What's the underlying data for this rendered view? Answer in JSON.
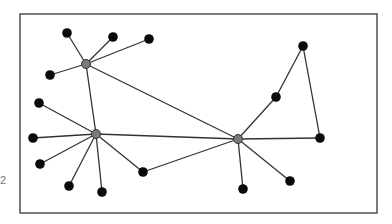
{
  "diagram": {
    "type": "network-graph",
    "frame": {
      "x": 20,
      "y": 14,
      "width": 357,
      "height": 199
    },
    "side_label": "2",
    "colors": {
      "leaf": "#0a0a0a",
      "hub": "#7a7a7a",
      "edge": "#333333",
      "frame": "#444444"
    },
    "nodes": [
      {
        "id": "A",
        "x": 86,
        "y": 64,
        "kind": "hub"
      },
      {
        "id": "B",
        "x": 96,
        "y": 134,
        "kind": "hub"
      },
      {
        "id": "C",
        "x": 238,
        "y": 139,
        "kind": "hub"
      },
      {
        "id": "a1",
        "x": 67,
        "y": 33,
        "kind": "leaf"
      },
      {
        "id": "a2",
        "x": 113,
        "y": 37,
        "kind": "leaf"
      },
      {
        "id": "a3",
        "x": 149,
        "y": 39,
        "kind": "leaf"
      },
      {
        "id": "a4",
        "x": 50,
        "y": 75,
        "kind": "leaf"
      },
      {
        "id": "b1",
        "x": 39,
        "y": 103,
        "kind": "leaf"
      },
      {
        "id": "b2",
        "x": 33,
        "y": 138,
        "kind": "leaf"
      },
      {
        "id": "b3",
        "x": 40,
        "y": 164,
        "kind": "leaf"
      },
      {
        "id": "b4",
        "x": 69,
        "y": 186,
        "kind": "leaf"
      },
      {
        "id": "b5",
        "x": 102,
        "y": 192,
        "kind": "leaf"
      },
      {
        "id": "b6",
        "x": 143,
        "y": 172,
        "kind": "leaf"
      },
      {
        "id": "c1",
        "x": 243,
        "y": 189,
        "kind": "leaf"
      },
      {
        "id": "c2",
        "x": 290,
        "y": 181,
        "kind": "leaf"
      },
      {
        "id": "c3",
        "x": 320,
        "y": 138,
        "kind": "leaf"
      },
      {
        "id": "c4",
        "x": 276,
        "y": 97,
        "kind": "leaf"
      },
      {
        "id": "c5",
        "x": 303,
        "y": 46,
        "kind": "leaf"
      }
    ],
    "edges": [
      [
        "A",
        "a1"
      ],
      [
        "A",
        "a2"
      ],
      [
        "A",
        "a3"
      ],
      [
        "A",
        "a4"
      ],
      [
        "A",
        "B"
      ],
      [
        "A",
        "C"
      ],
      [
        "B",
        "b1"
      ],
      [
        "B",
        "b2"
      ],
      [
        "B",
        "b3"
      ],
      [
        "B",
        "b4"
      ],
      [
        "B",
        "b5"
      ],
      [
        "B",
        "b6"
      ],
      [
        "B",
        "C"
      ],
      [
        "b6",
        "C"
      ],
      [
        "C",
        "c1"
      ],
      [
        "C",
        "c2"
      ],
      [
        "C",
        "c3"
      ],
      [
        "C",
        "c4"
      ],
      [
        "c4",
        "c5"
      ],
      [
        "c5",
        "c3"
      ]
    ]
  }
}
